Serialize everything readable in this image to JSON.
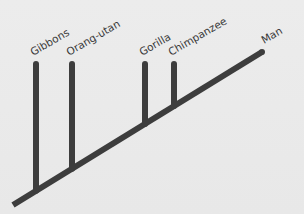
{
  "diagram": {
    "type": "phylogenetic-tree",
    "line_color": "#3d3d3d",
    "background": "#e9e9e9",
    "taxa": [
      {
        "name": "Gibbons",
        "order": 1
      },
      {
        "name": "Orang-utan",
        "order": 2
      },
      {
        "name": "Gorilla",
        "order": 3
      },
      {
        "name": "Chimpanzee",
        "order": 4
      },
      {
        "name": "Man",
        "order": 5
      }
    ],
    "edges": [
      {
        "from": "root",
        "to": "Gibbons"
      },
      {
        "from": "root",
        "to": "Orang-utan"
      },
      {
        "from": "root",
        "to": "Gorilla"
      },
      {
        "from": "root",
        "to": "Chimpanzee"
      },
      {
        "from": "root",
        "to": "Man"
      }
    ]
  }
}
